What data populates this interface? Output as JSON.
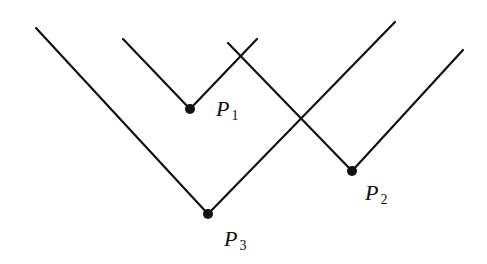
{
  "diagram": {
    "stroke_color": "#111111",
    "background": "#ffffff",
    "points": [
      {
        "id": "P1",
        "letter": "P",
        "sub": "1",
        "x": 190,
        "y": 109,
        "label_x": 216,
        "label_y": 96,
        "left_arm": [
          123,
          39
        ],
        "right_arm": [
          257,
          39
        ]
      },
      {
        "id": "P2",
        "letter": "P",
        "sub": "2",
        "x": 352,
        "y": 171,
        "label_x": 365,
        "label_y": 180,
        "left_arm": [
          228,
          43
        ],
        "right_arm": [
          463,
          50
        ]
      },
      {
        "id": "P3",
        "letter": "P",
        "sub": "3",
        "x": 208,
        "y": 214,
        "label_x": 224,
        "label_y": 226,
        "left_arm": [
          36,
          28
        ],
        "right_arm": [
          395,
          22
        ]
      }
    ]
  }
}
